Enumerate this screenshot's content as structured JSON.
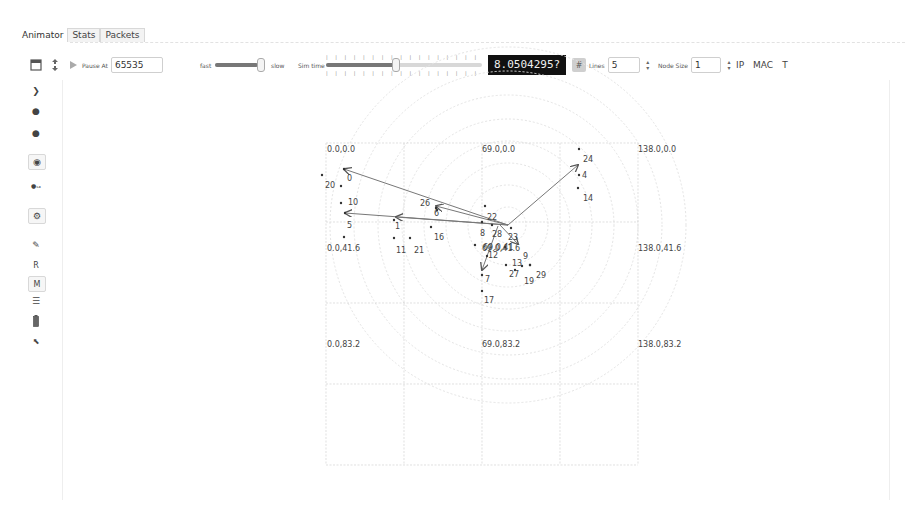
{
  "tabs": [
    {
      "label": "Animator",
      "active": true
    },
    {
      "label": "Stats",
      "active": false
    },
    {
      "label": "Packets",
      "active": false
    }
  ],
  "toolbar": {
    "pause_label": "Pause At",
    "pause_value": "65535",
    "fast_label": "fast",
    "slow_label": "slow",
    "sim_time_label": "Sim time",
    "sim_time_display": "8.0504295?",
    "lines_label": "Lines",
    "lines_value": "5",
    "node_size_label": "Node Size",
    "node_size_value": "1",
    "ip_label": "IP",
    "mac_label": "MAC",
    "t_label": "T",
    "speed_slider_percent": 82,
    "simtime_slider_percent": 26
  },
  "sidebar": {
    "r_label": "R",
    "m_label": "M"
  },
  "canvas": {
    "grid_labels": [
      {
        "text": "0.0,0.0",
        "x": 327,
        "y": 152
      },
      {
        "text": "69.0,0.0",
        "x": 482,
        "y": 152
      },
      {
        "text": "138.0,0.0",
        "x": 638,
        "y": 152
      },
      {
        "text": "0.0,41.6",
        "x": 327,
        "y": 251
      },
      {
        "text": "69.0,41.6",
        "x": 482,
        "y": 251
      },
      {
        "text": "138.0,41.6",
        "x": 638,
        "y": 251
      },
      {
        "text": "0.0,83.2",
        "x": 327,
        "y": 347
      },
      {
        "text": "69.0,83.2",
        "x": 482,
        "y": 347
      },
      {
        "text": "138.0,83.2",
        "x": 638,
        "y": 347
      }
    ],
    "nodes": [
      {
        "id": "0",
        "x": 344,
        "y": 169,
        "lx": 347,
        "ly": 181
      },
      {
        "id": "20",
        "x": 322,
        "y": 175,
        "lx": 325,
        "ly": 188
      },
      {
        "id": "10",
        "x": 341,
        "y": 203,
        "lx": 348,
        "ly": 205
      },
      {
        "id": "24b",
        "label": "",
        "x": 341,
        "y": 186,
        "lx": 0,
        "ly": 0
      },
      {
        "id": "5",
        "x": 345,
        "y": 213,
        "lx": 347,
        "ly": 228
      },
      {
        "id": "18",
        "label": "",
        "x": 344,
        "y": 237,
        "lx": 0,
        "ly": 0
      },
      {
        "id": "1",
        "x": 394,
        "y": 220,
        "lx": 395,
        "ly": 229
      },
      {
        "id": "11",
        "x": 394,
        "y": 238,
        "lx": 396,
        "ly": 253
      },
      {
        "id": "21",
        "x": 410,
        "y": 238,
        "lx": 414,
        "ly": 253
      },
      {
        "id": "26",
        "x": 436,
        "y": 208,
        "lx": 420,
        "ly": 206
      },
      {
        "id": "6",
        "x": 437,
        "y": 210,
        "lx": 434,
        "ly": 216
      },
      {
        "id": "16",
        "x": 431,
        "y": 227,
        "lx": 434,
        "ly": 240
      },
      {
        "id": "22",
        "x": 485,
        "y": 206,
        "lx": 487,
        "ly": 220
      },
      {
        "id": "8",
        "x": 482,
        "y": 222,
        "lx": 480,
        "ly": 236
      },
      {
        "id": "28",
        "x": 492,
        "y": 225,
        "lx": 492,
        "ly": 237
      },
      {
        "id": "23",
        "x": 511,
        "y": 228,
        "lx": 508,
        "ly": 240
      },
      {
        "id": "15",
        "x": 475,
        "y": 245,
        "lx": 0,
        "ly": 0,
        "label": ""
      },
      {
        "id": "12",
        "x": 487,
        "y": 256,
        "lx": 488,
        "ly": 258
      },
      {
        "id": "3",
        "x": 505,
        "y": 247,
        "lx": 0,
        "ly": 0,
        "label": ""
      },
      {
        "id": "13",
        "x": 506,
        "y": 265,
        "lx": 512,
        "ly": 266
      },
      {
        "id": "9",
        "x": 522,
        "y": 266,
        "lx": 523,
        "ly": 259
      },
      {
        "id": "27",
        "x": 515,
        "y": 270,
        "lx": 509,
        "ly": 277
      },
      {
        "id": "19",
        "x": 530,
        "y": 265,
        "lx": 524,
        "ly": 284
      },
      {
        "id": "29",
        "x": 530,
        "y": 265,
        "lx": 536,
        "ly": 278
      },
      {
        "id": "7",
        "x": 482,
        "y": 275,
        "lx": 485,
        "ly": 282
      },
      {
        "id": "17",
        "x": 482,
        "y": 291,
        "lx": 484,
        "ly": 303
      },
      {
        "id": "24",
        "x": 579,
        "y": 149,
        "lx": 583,
        "ly": 162
      },
      {
        "id": "4",
        "x": 579,
        "y": 175,
        "lx": 582,
        "ly": 178
      },
      {
        "id": "14",
        "x": 578,
        "y": 188,
        "lx": 583,
        "ly": 201
      }
    ],
    "arrows": [
      {
        "x1": 508,
        "y1": 225,
        "x2": 344,
        "y2": 169
      },
      {
        "x1": 508,
        "y1": 225,
        "x2": 436,
        "y2": 206
      },
      {
        "x1": 508,
        "y1": 225,
        "x2": 345,
        "y2": 213
      },
      {
        "x1": 508,
        "y1": 225,
        "x2": 396,
        "y2": 217
      },
      {
        "x1": 508,
        "y1": 225,
        "x2": 578,
        "y2": 165
      },
      {
        "x1": 498,
        "y1": 226,
        "x2": 482,
        "y2": 270
      },
      {
        "x1": 500,
        "y1": 225,
        "x2": 518,
        "y2": 244
      }
    ],
    "cluster_label": "69.0,41",
    "circles_center": [
      508,
      225
    ],
    "circles_radii": [
      18,
      40,
      62,
      84,
      106,
      130,
      154,
      178
    ],
    "colors": {
      "grid": "#cfcfcf",
      "circle": "#e4e4e4",
      "arrow": "#777777",
      "node": "#333333",
      "text": "#444444"
    }
  }
}
